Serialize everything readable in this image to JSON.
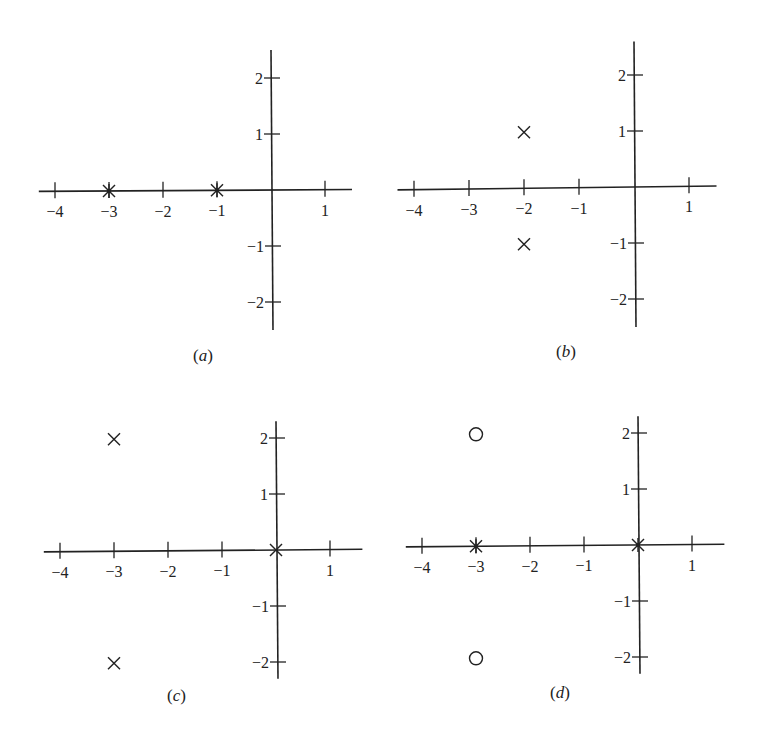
{
  "chart_data": [
    {
      "type": "scatter",
      "id": "a",
      "caption": "(a)",
      "caption_label": "a",
      "xlabel": "",
      "ylabel": "",
      "x_ticks": [
        -4,
        -3,
        -2,
        -1,
        1
      ],
      "y_ticks": [
        2,
        1,
        -1,
        -2
      ],
      "x_tick_labels": [
        "−4",
        "−3",
        "−2",
        "−1",
        "1"
      ],
      "y_tick_labels": [
        "2",
        "1",
        "−1",
        "−2"
      ],
      "xlim": [
        -4.3,
        1.5
      ],
      "ylim": [
        -2.5,
        2.5
      ],
      "grid": false,
      "points": [
        {
          "re": -3,
          "im": 0,
          "marker": "asterisk"
        },
        {
          "re": -1,
          "im": 0,
          "marker": "asterisk"
        }
      ]
    },
    {
      "type": "scatter",
      "id": "b",
      "caption": "(b)",
      "caption_label": "b",
      "xlabel": "",
      "ylabel": "",
      "x_ticks": [
        -4,
        -3,
        -2,
        -1,
        1
      ],
      "y_ticks": [
        2,
        1,
        -1,
        -2
      ],
      "x_tick_labels": [
        "−4",
        "−3",
        "−2",
        "−1",
        "1"
      ],
      "y_tick_labels": [
        "2",
        "1",
        "−1",
        "−2"
      ],
      "xlim": [
        -4.3,
        1.5
      ],
      "ylim": [
        -2.5,
        2.5
      ],
      "grid": false,
      "points": [
        {
          "re": -2,
          "im": 1,
          "marker": "x"
        },
        {
          "re": -2,
          "im": -1,
          "marker": "x"
        }
      ]
    },
    {
      "type": "scatter",
      "id": "c",
      "caption": "(c)",
      "caption_label": "c",
      "xlabel": "",
      "ylabel": "",
      "x_ticks": [
        -4,
        -3,
        -2,
        -1,
        1
      ],
      "y_ticks": [
        2,
        1,
        -1,
        -2
      ],
      "x_tick_labels": [
        "−4",
        "−3",
        "−2",
        "−1",
        "1"
      ],
      "y_tick_labels": [
        "2",
        "1",
        "−1",
        "−2"
      ],
      "xlim": [
        -4.3,
        1.5
      ],
      "ylim": [
        -2.3,
        2.3
      ],
      "grid": false,
      "points": [
        {
          "re": -3,
          "im": 2,
          "marker": "x"
        },
        {
          "re": -3,
          "im": -2,
          "marker": "x"
        },
        {
          "re": 0,
          "im": 0,
          "marker": "x"
        }
      ]
    },
    {
      "type": "scatter",
      "id": "d",
      "caption": "(d)",
      "caption_label": "d",
      "xlabel": "",
      "ylabel": "",
      "x_ticks": [
        -4,
        -3,
        -2,
        -1,
        1
      ],
      "y_ticks": [
        2,
        1,
        -1,
        -2
      ],
      "x_tick_labels": [
        "−4",
        "−3",
        "−2",
        "−1",
        "1"
      ],
      "y_tick_labels": [
        "2",
        "1",
        "−1",
        "−2"
      ],
      "xlim": [
        -4.3,
        1.5
      ],
      "ylim": [
        -2.3,
        2.3
      ],
      "grid": false,
      "points": [
        {
          "re": -3,
          "im": 2,
          "marker": "o"
        },
        {
          "re": -3,
          "im": -2,
          "marker": "o"
        },
        {
          "re": -3,
          "im": 0,
          "marker": "asterisk"
        },
        {
          "re": 0,
          "im": 0,
          "marker": "asterisk"
        }
      ]
    }
  ],
  "colors": {
    "ink": "#222222",
    "background": "#ffffff"
  }
}
